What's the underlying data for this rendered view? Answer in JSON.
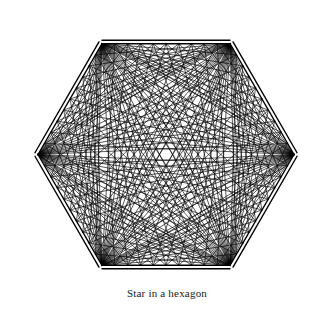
{
  "figure": {
    "caption": "Star in a hexagon",
    "title": "Star in a hexagon",
    "background_color": "#ffffff",
    "stroke_color": "#000000",
    "outline_stroke_width": 1.4,
    "web_stroke_width": 0.65
  },
  "chart_data": {
    "type": "diagram",
    "title": "Star in a hexagon",
    "shape": "hexagon",
    "sides": 6,
    "divisions_per_edge": 10,
    "center": {
      "x": 166,
      "y": 154.5
    },
    "radius": 128,
    "orientation_degrees": 30,
    "outline_offset": 3.5,
    "vertices": [
      {
        "index": 0,
        "label": "top-right",
        "x": 230.0,
        "y": 43.7
      },
      {
        "index": 1,
        "label": "right",
        "x": 294.0,
        "y": 154.5
      },
      {
        "index": 2,
        "label": "bottom-right",
        "x": 230.0,
        "y": 265.3
      },
      {
        "index": 3,
        "label": "bottom-left",
        "x": 102.0,
        "y": 265.3
      },
      {
        "index": 4,
        "label": "left",
        "x": 38.0,
        "y": 154.5
      },
      {
        "index": 5,
        "label": "top-left",
        "x": 102.0,
        "y": 43.7
      }
    ],
    "edges": [
      {
        "from": 0,
        "to": 1,
        "label": "upper-right"
      },
      {
        "from": 1,
        "to": 2,
        "label": "lower-right"
      },
      {
        "from": 2,
        "to": 3,
        "label": "bottom"
      },
      {
        "from": 3,
        "to": 4,
        "label": "lower-left"
      },
      {
        "from": 4,
        "to": 5,
        "label": "upper-left"
      },
      {
        "from": 5,
        "to": 0,
        "label": "top"
      }
    ],
    "chord_rule": "Each vertex is joined to every division point on the two edges that are not adjacent to it (the opposite edge and the two edges one step away), producing the star pattern.",
    "grid": false,
    "legend": false
  }
}
